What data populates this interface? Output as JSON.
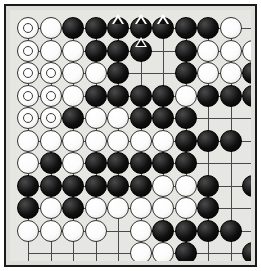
{
  "app": {
    "title": "Go Board Position",
    "board_type": "go-goban"
  },
  "board": {
    "columns": 11,
    "rows": 12,
    "cell_size": 22.5,
    "origin_x": 18,
    "origin_y": 18,
    "stone_radius": 11,
    "line_color": "#4a4a4a",
    "board_color": "#e6e6e2",
    "frame_color": "#1a1a1a",
    "black_color": "#000000",
    "white_color": "#ffffff",
    "hoshi_points": [
      [
        2,
        5
      ],
      [
        5,
        5
      ],
      [
        8,
        5
      ],
      [
        2,
        8
      ],
      [
        5,
        8
      ],
      [
        8,
        8
      ]
    ],
    "legend": {
      "triangle_mark": "triangle-marked-stone",
      "circle_mark": "circle-marked-stone"
    },
    "stones": [
      {
        "col": 0,
        "row": 0,
        "color": "white",
        "mark": "circle"
      },
      {
        "col": 1,
        "row": 0,
        "color": "white",
        "mark": null
      },
      {
        "col": 2,
        "row": 0,
        "color": "black",
        "mark": null
      },
      {
        "col": 3,
        "row": 0,
        "color": "black",
        "mark": null
      },
      {
        "col": 4,
        "row": 0,
        "color": "black",
        "mark": "triangle"
      },
      {
        "col": 5,
        "row": 0,
        "color": "black",
        "mark": "triangle"
      },
      {
        "col": 6,
        "row": 0,
        "color": "black",
        "mark": "triangle"
      },
      {
        "col": 7,
        "row": 0,
        "color": "black",
        "mark": null
      },
      {
        "col": 8,
        "row": 0,
        "color": "black",
        "mark": null
      },
      {
        "col": 9,
        "row": 0,
        "color": "white",
        "mark": null
      },
      {
        "col": 0,
        "row": 1,
        "color": "white",
        "mark": "circle"
      },
      {
        "col": 1,
        "row": 1,
        "color": "white",
        "mark": null
      },
      {
        "col": 2,
        "row": 1,
        "color": "white",
        "mark": null
      },
      {
        "col": 3,
        "row": 1,
        "color": "black",
        "mark": null
      },
      {
        "col": 4,
        "row": 1,
        "color": "black",
        "mark": null
      },
      {
        "col": 5,
        "row": 1,
        "color": "black",
        "mark": "triangle"
      },
      {
        "col": 7,
        "row": 1,
        "color": "black",
        "mark": null
      },
      {
        "col": 8,
        "row": 1,
        "color": "white",
        "mark": null
      },
      {
        "col": 9,
        "row": 1,
        "color": "white",
        "mark": null
      },
      {
        "col": 10,
        "row": 1,
        "color": "white",
        "mark": null
      },
      {
        "col": 0,
        "row": 2,
        "color": "white",
        "mark": "circle"
      },
      {
        "col": 1,
        "row": 2,
        "color": "white",
        "mark": "circle"
      },
      {
        "col": 2,
        "row": 2,
        "color": "white",
        "mark": null
      },
      {
        "col": 3,
        "row": 2,
        "color": "white",
        "mark": null
      },
      {
        "col": 4,
        "row": 2,
        "color": "black",
        "mark": null
      },
      {
        "col": 7,
        "row": 2,
        "color": "black",
        "mark": null
      },
      {
        "col": 8,
        "row": 2,
        "color": "white",
        "mark": null
      },
      {
        "col": 9,
        "row": 2,
        "color": "white",
        "mark": null
      },
      {
        "col": 10,
        "row": 2,
        "color": "black",
        "mark": null
      },
      {
        "col": 0,
        "row": 3,
        "color": "white",
        "mark": "circle"
      },
      {
        "col": 1,
        "row": 3,
        "color": "white",
        "mark": "circle"
      },
      {
        "col": 2,
        "row": 3,
        "color": "white",
        "mark": null
      },
      {
        "col": 3,
        "row": 3,
        "color": "black",
        "mark": null
      },
      {
        "col": 4,
        "row": 3,
        "color": "black",
        "mark": null
      },
      {
        "col": 5,
        "row": 3,
        "color": "black",
        "mark": null
      },
      {
        "col": 6,
        "row": 3,
        "color": "black",
        "mark": null
      },
      {
        "col": 7,
        "row": 3,
        "color": "white",
        "mark": null
      },
      {
        "col": 8,
        "row": 3,
        "color": "black",
        "mark": null
      },
      {
        "col": 9,
        "row": 3,
        "color": "black",
        "mark": null
      },
      {
        "col": 10,
        "row": 3,
        "color": "black",
        "mark": null
      },
      {
        "col": 0,
        "row": 4,
        "color": "white",
        "mark": "circle"
      },
      {
        "col": 1,
        "row": 4,
        "color": "white",
        "mark": "circle"
      },
      {
        "col": 2,
        "row": 4,
        "color": "black",
        "mark": null
      },
      {
        "col": 3,
        "row": 4,
        "color": "white",
        "mark": null
      },
      {
        "col": 4,
        "row": 4,
        "color": "white",
        "mark": null
      },
      {
        "col": 5,
        "row": 4,
        "color": "black",
        "mark": null
      },
      {
        "col": 6,
        "row": 4,
        "color": "black",
        "mark": null
      },
      {
        "col": 7,
        "row": 4,
        "color": "black",
        "mark": null
      },
      {
        "col": 0,
        "row": 5,
        "color": "white",
        "mark": null
      },
      {
        "col": 1,
        "row": 5,
        "color": "white",
        "mark": null
      },
      {
        "col": 2,
        "row": 5,
        "color": "white",
        "mark": null
      },
      {
        "col": 3,
        "row": 5,
        "color": "white",
        "mark": null
      },
      {
        "col": 4,
        "row": 5,
        "color": "white",
        "mark": null
      },
      {
        "col": 5,
        "row": 5,
        "color": "white",
        "mark": null
      },
      {
        "col": 6,
        "row": 5,
        "color": "white",
        "mark": null
      },
      {
        "col": 7,
        "row": 5,
        "color": "black",
        "mark": null
      },
      {
        "col": 8,
        "row": 5,
        "color": "black",
        "mark": null
      },
      {
        "col": 9,
        "row": 5,
        "color": "black",
        "mark": null
      },
      {
        "col": 0,
        "row": 6,
        "color": "white",
        "mark": null
      },
      {
        "col": 1,
        "row": 6,
        "color": "black",
        "mark": null
      },
      {
        "col": 2,
        "row": 6,
        "color": "white",
        "mark": null
      },
      {
        "col": 3,
        "row": 6,
        "color": "black",
        "mark": null
      },
      {
        "col": 4,
        "row": 6,
        "color": "black",
        "mark": null
      },
      {
        "col": 5,
        "row": 6,
        "color": "black",
        "mark": null
      },
      {
        "col": 6,
        "row": 6,
        "color": "black",
        "mark": null
      },
      {
        "col": 7,
        "row": 6,
        "color": "black",
        "mark": null
      },
      {
        "col": 0,
        "row": 7,
        "color": "black",
        "mark": null
      },
      {
        "col": 1,
        "row": 7,
        "color": "black",
        "mark": null
      },
      {
        "col": 2,
        "row": 7,
        "color": "black",
        "mark": null
      },
      {
        "col": 3,
        "row": 7,
        "color": "black",
        "mark": null
      },
      {
        "col": 4,
        "row": 7,
        "color": "black",
        "mark": null
      },
      {
        "col": 5,
        "row": 7,
        "color": "black",
        "mark": null
      },
      {
        "col": 6,
        "row": 7,
        "color": "white",
        "mark": null
      },
      {
        "col": 7,
        "row": 7,
        "color": "white",
        "mark": null
      },
      {
        "col": 8,
        "row": 7,
        "color": "black",
        "mark": null
      },
      {
        "col": 10,
        "row": 7,
        "color": "black",
        "mark": null
      },
      {
        "col": 0,
        "row": 8,
        "color": "black",
        "mark": null
      },
      {
        "col": 1,
        "row": 8,
        "color": "white",
        "mark": null
      },
      {
        "col": 2,
        "row": 8,
        "color": "black",
        "mark": null
      },
      {
        "col": 3,
        "row": 8,
        "color": "white",
        "mark": null
      },
      {
        "col": 4,
        "row": 8,
        "color": "white",
        "mark": null
      },
      {
        "col": 5,
        "row": 8,
        "color": "white",
        "mark": null
      },
      {
        "col": 6,
        "row": 8,
        "color": "white",
        "mark": null
      },
      {
        "col": 7,
        "row": 8,
        "color": "white",
        "mark": null
      },
      {
        "col": 8,
        "row": 8,
        "color": "black",
        "mark": null
      },
      {
        "col": 0,
        "row": 9,
        "color": "white",
        "mark": null
      },
      {
        "col": 1,
        "row": 9,
        "color": "white",
        "mark": null
      },
      {
        "col": 2,
        "row": 9,
        "color": "white",
        "mark": null
      },
      {
        "col": 3,
        "row": 9,
        "color": "white",
        "mark": null
      },
      {
        "col": 5,
        "row": 9,
        "color": "white",
        "mark": null
      },
      {
        "col": 6,
        "row": 9,
        "color": "black",
        "mark": null
      },
      {
        "col": 7,
        "row": 9,
        "color": "black",
        "mark": null
      },
      {
        "col": 8,
        "row": 9,
        "color": "black",
        "mark": null
      },
      {
        "col": 9,
        "row": 9,
        "color": "black",
        "mark": null
      },
      {
        "col": 5,
        "row": 10,
        "color": "white",
        "mark": null
      },
      {
        "col": 6,
        "row": 10,
        "color": "white",
        "mark": null
      },
      {
        "col": 7,
        "row": 10,
        "color": "black",
        "mark": null
      },
      {
        "col": 10,
        "row": 10,
        "color": "black",
        "mark": null
      },
      {
        "col": 6,
        "row": 11,
        "color": "white",
        "mark": null
      },
      {
        "col": 7,
        "row": 11,
        "color": "white",
        "mark": "circle"
      },
      {
        "col": 8,
        "row": 11,
        "color": "white",
        "mark": null
      },
      {
        "col": 9,
        "row": 11,
        "color": "black",
        "mark": null
      },
      {
        "col": 10,
        "row": 11,
        "color": "black",
        "mark": null
      },
      {
        "col": 7,
        "row": 12,
        "color": "white",
        "mark": null
      },
      {
        "col": 8,
        "row": 12,
        "color": "white",
        "mark": null
      },
      {
        "col": 9,
        "row": 12,
        "color": "white",
        "mark": null
      },
      {
        "col": 10,
        "row": 12,
        "color": "black",
        "mark": null
      }
    ]
  }
}
